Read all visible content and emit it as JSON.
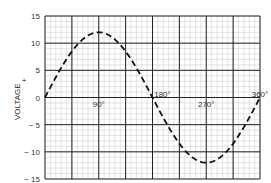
{
  "chart_data": {
    "type": "line",
    "title": "",
    "xlabel": "",
    "ylabel": "VOLTAGE",
    "ylabel_sign": "+",
    "ylim": [
      -15,
      15
    ],
    "xlim": [
      0,
      360
    ],
    "yticks": [
      15,
      10,
      5,
      0,
      -5,
      -10,
      -15
    ],
    "ytick_labels": [
      "15",
      "10",
      "5",
      "0",
      "− 5",
      "− 10",
      "− 15"
    ],
    "x_annotations": [
      "90°",
      "180°",
      "270°",
      "360°"
    ],
    "grid": true,
    "series": [
      {
        "name": "sine wave",
        "style": "dashed",
        "x": [
          0,
          30,
          60,
          90,
          120,
          150,
          180,
          210,
          240,
          270,
          300,
          330,
          360
        ],
        "values": [
          0,
          6,
          10.4,
          12,
          10.4,
          6,
          0,
          -6,
          -10.4,
          -12,
          -10.4,
          -6,
          0
        ]
      }
    ],
    "amplitude": 12
  }
}
